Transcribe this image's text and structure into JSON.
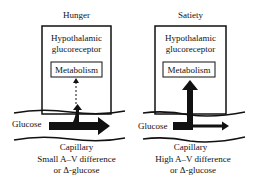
{
  "panels": [
    {
      "title": "Hunger",
      "receptor_line1": "Hypothalamic",
      "receptor_line2": "glucoreceptor",
      "metabolism": "Metabolism",
      "glucose_label": "Glucose",
      "capillary_label": "Capillary",
      "caption_line1": "Small A–V difference",
      "caption_line2": "or Δ-glucose",
      "uptake": "small (dotted arrow)"
    },
    {
      "title": "Satiety",
      "receptor_line1": "Hypothalamic",
      "receptor_line2": "glucoreceptor",
      "metabolism": "Metabolism",
      "glucose_label": "Glucose",
      "capillary_label": "Capillary",
      "caption_line1": "High A–V difference",
      "caption_line2": "or Δ-glucose",
      "uptake": "large (thick arrow)"
    }
  ]
}
